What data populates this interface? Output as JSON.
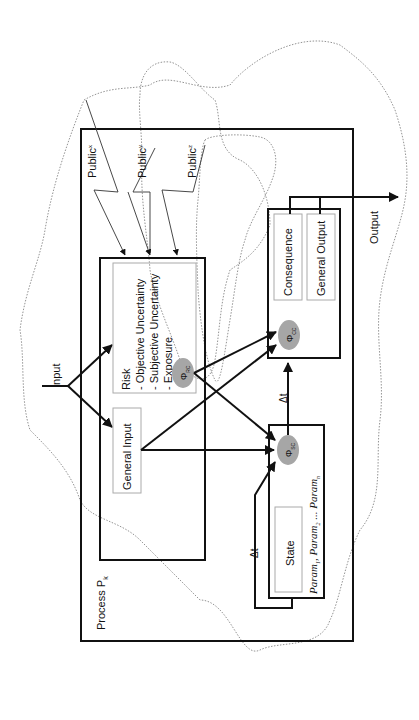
{
  "diagram": {
    "process_label": "Process P",
    "process_subscript": "k",
    "input_label": "Input",
    "output_label": "Output",
    "publics": [
      {
        "label": "Public",
        "subscript": "x"
      },
      {
        "label": "Public",
        "subscript": "y"
      },
      {
        "label": "Public",
        "subscript": "z"
      }
    ],
    "risk_box": {
      "title": "Risk",
      "items": [
        "- Objective Uncertainty",
        "- Subjective Uncertainty",
        "- Exposure"
      ]
    },
    "general_input_label": "General Input",
    "consequence_label": "Consequence",
    "general_output_label": "General Output",
    "state_label": "State",
    "params": {
      "p1": "Param",
      "p1_sub": "1",
      "p2": "Param",
      "p2_sub": "2",
      "sep": "...",
      "pn": "Param",
      "pn_sub": "n"
    },
    "phi_nodes": [
      {
        "symbol": "Φ",
        "subscript": "RC"
      },
      {
        "symbol": "Φ",
        "subscript": "CC"
      },
      {
        "symbol": "Φ",
        "subscript": "SC"
      }
    ],
    "delta_t_label": "Δt",
    "colors": {
      "ellipse_fill": "#a6a6a6",
      "line": "#111111",
      "inner_box": "#aaaaaa",
      "dotted": "#777777"
    }
  }
}
